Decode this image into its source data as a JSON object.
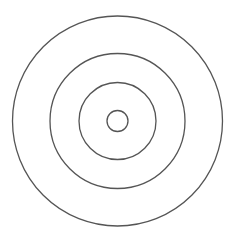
{
  "diagram": {
    "type": "concentric-circles",
    "background": "#ffffff",
    "stroke_color": "#555555",
    "stroke_width": 1.3,
    "center": {
      "x": 117.5,
      "y": 121
    },
    "circles": [
      {
        "name": "outer-ring",
        "r": 105
      },
      {
        "name": "second-ring",
        "r": 67.5
      },
      {
        "name": "third-ring",
        "r": 38.5
      },
      {
        "name": "inner-ring",
        "r": 10.5
      }
    ]
  }
}
